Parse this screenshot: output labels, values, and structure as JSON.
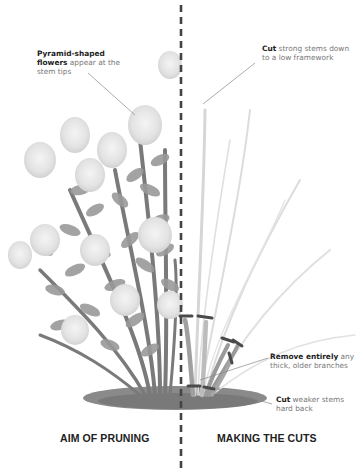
{
  "diagram": {
    "title_left": "AIM OF PRUNING",
    "title_right": "MAKING THE CUTS",
    "divider": "dashed-vertical-line",
    "colors": {
      "left_plant_foliage": "#8f8f8f",
      "left_plant_flowers": "#e6e6e6",
      "right_stems_light": "#d4d4d4",
      "right_stems_dark": "#9a9a9a",
      "cut_marks": "#555555",
      "soil": "#777777",
      "divider": "#444444",
      "heading_text": "#222222",
      "label_text": "#777777"
    },
    "annotations": [
      {
        "id": "flowers",
        "bold": "Pyramid-shaped flowers",
        "text": " appear at the stem tips"
      },
      {
        "id": "cut-strong",
        "bold": "Cut",
        "text": " strong stems down to a low framework"
      },
      {
        "id": "remove-old",
        "bold": "Remove entirely",
        "text": " any thick, older branches"
      },
      {
        "id": "cut-weak",
        "bold": "Cut",
        "text": " weaker stems hard back"
      }
    ]
  }
}
